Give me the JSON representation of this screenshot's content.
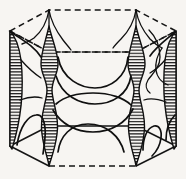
{
  "figure": {
    "title": "Fermi surface within hexagonal Brillouin zone",
    "caption": "",
    "background_color": "#f7f5f2",
    "ink_color": "#151515",
    "width_px": 186,
    "height_px": 179
  },
  "chart_data": {
    "type": "diagram",
    "title": "Fermi surface within hexagonal Brillouin zone",
    "subtitle": "",
    "xlabel": "",
    "ylabel": "",
    "legend": [],
    "annotations": [],
    "grid": false,
    "zone": {
      "shape": "hexagonal-prism",
      "projection": "oblique",
      "top_face_style": "dashed",
      "bottom_face_style": "dashed-front-solid-side",
      "vertical_edge_style": "solid",
      "top_hexagon_vertices": [
        [
          10,
          31
        ],
        [
          49,
          10
        ],
        [
          136,
          10
        ],
        [
          176,
          31
        ],
        [
          136,
          52
        ],
        [
          49,
          52
        ]
      ],
      "bottom_hexagon_vertices": [
        [
          10,
          146
        ],
        [
          49,
          166
        ],
        [
          136,
          166
        ],
        [
          176,
          146
        ],
        [
          136,
          126
        ],
        [
          49,
          126
        ]
      ],
      "vertical_edges_x": [
        10,
        49,
        136,
        176
      ]
    },
    "features": [
      {
        "name": "corner-spindle",
        "description": "hatched vertical hourglass column at zone corner",
        "count": 2,
        "centers_x": [
          49,
          136
        ],
        "top_y": 26,
        "bottom_y": 166,
        "hatching": "horizontal-line-fill"
      },
      {
        "name": "edge-hatched-sliver",
        "description": "hatched crescent along left and right vertical zone edges",
        "count": 2,
        "centers_x": [
          12,
          174
        ],
        "top_y": 31,
        "bottom_y": 150,
        "hatching": "horizontal-line-fill"
      },
      {
        "name": "central-lens",
        "description": "lens shaped sheet across the middle of the zone",
        "count": 1,
        "center": [
          92,
          95
        ]
      },
      {
        "name": "upper-dome",
        "description": "downward opening dome in upper half",
        "count": 1,
        "center": [
          92,
          55
        ]
      },
      {
        "name": "lower-dome",
        "description": "upward opening dome in lower half",
        "count": 1,
        "center": [
          92,
          148
        ]
      },
      {
        "name": "side-lobe",
        "description": "small hooked lobe near the right rear corner",
        "count": 2
      }
    ],
    "colors": {
      "line": "#101010",
      "hatch": "#101010",
      "background": "#f7f5f2"
    }
  }
}
